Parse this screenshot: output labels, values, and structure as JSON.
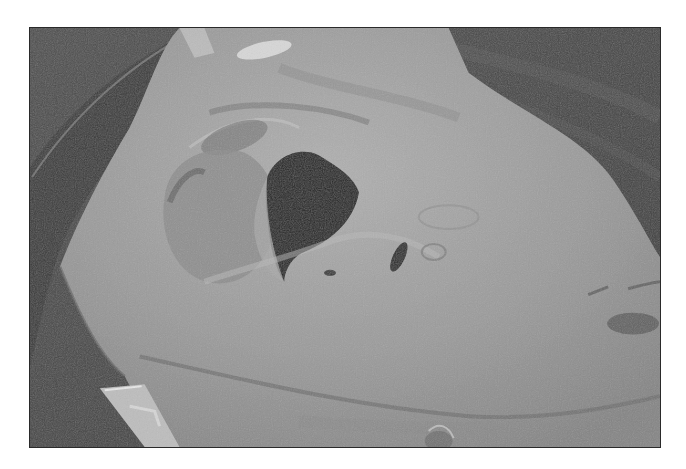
{
  "image": {
    "kind": "scanning electron micrograph",
    "subject": "tissue specimen with central opening",
    "palette": {
      "background_dark": "#474747",
      "rim_ring": "#3a3a3a",
      "rim_highlight": "#8a8a8a",
      "tissue_main": "#9a9a9a",
      "tissue_light": "#b4b4b4",
      "tissue_shadow": "#7a7a7a",
      "opening_dark": "#262626",
      "border": "#2a2a2a"
    }
  }
}
